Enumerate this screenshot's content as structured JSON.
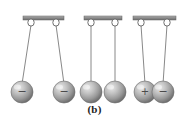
{
  "figure": {
    "caption": "(b)",
    "background_color": "#ffffff",
    "bar_color": "#8a8a8a",
    "bar_edge_color": "#6e6e6e",
    "string_color": "#7a7a7a",
    "hook_color": "#9a9a9a",
    "sphere_light": "#e0e0e0",
    "sphere_mid": "#a8a8a8",
    "sphere_dark": "#6f6f6f",
    "sign_color": "#4a4a4a",
    "panels": [
      {
        "id": "panel-repel",
        "label": "two negative charges repel",
        "bar": {
          "x1": 23,
          "x2": 64,
          "y": 18
        },
        "hooks": [
          {
            "x": 31,
            "y": 21
          },
          {
            "x": 56,
            "y": 21
          }
        ],
        "strings": [
          {
            "x1": 31,
            "y1": 25,
            "x2": 22,
            "y2": 85
          },
          {
            "x1": 56,
            "y1": 25,
            "x2": 64,
            "y2": 85
          }
        ],
        "spheres": [
          {
            "cx": 22,
            "cy": 92,
            "r": 11,
            "sign": "−",
            "charge": "negative"
          },
          {
            "cx": 64,
            "cy": 92,
            "r": 11,
            "sign": "−",
            "charge": "negative"
          }
        ]
      },
      {
        "id": "panel-neutral",
        "label": "two neutral spheres hang vertically",
        "bar": {
          "x1": 84,
          "x2": 122,
          "y": 18
        },
        "hooks": [
          {
            "x": 91,
            "y": 21
          },
          {
            "x": 115,
            "y": 21
          }
        ],
        "strings": [
          {
            "x1": 91,
            "y1": 25,
            "x2": 91,
            "y2": 85
          },
          {
            "x1": 115,
            "y1": 25,
            "x2": 115,
            "y2": 85
          }
        ],
        "spheres": [
          {
            "cx": 91,
            "cy": 92,
            "r": 11,
            "sign": "",
            "charge": "neutral"
          },
          {
            "cx": 115,
            "cy": 92,
            "r": 11,
            "sign": "",
            "charge": "neutral"
          }
        ]
      },
      {
        "id": "panel-attract",
        "label": "opposite charges attract",
        "bar": {
          "x1": 133,
          "x2": 176,
          "y": 18
        },
        "hooks": [
          {
            "x": 141,
            "y": 21
          },
          {
            "x": 167,
            "y": 21
          }
        ],
        "strings": [
          {
            "x1": 141,
            "y1": 25,
            "x2": 145,
            "y2": 85
          },
          {
            "x1": 167,
            "y1": 25,
            "x2": 163,
            "y2": 85
          }
        ],
        "spheres": [
          {
            "cx": 145,
            "cy": 92,
            "r": 11,
            "sign": "+",
            "charge": "positive"
          },
          {
            "cx": 163,
            "cy": 92,
            "r": 11,
            "sign": "−",
            "charge": "negative"
          }
        ]
      }
    ]
  }
}
